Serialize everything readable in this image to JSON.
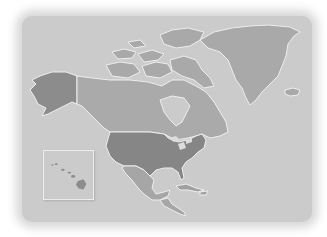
{
  "map": {
    "region": "North America",
    "style": "grayscale",
    "colors": {
      "background": "#ffffff",
      "ocean": "#cbcbcb",
      "border": "#eeeeee",
      "alaska": "#8c8c8c",
      "canada": "#aaaaaa",
      "usa": "#868686",
      "mexico": "#a6a6a6",
      "central_america": "#a6a6a6",
      "caribbean": "#a0a0a0",
      "greenland": "#a9a9a9",
      "iceland": "#a9a9a9",
      "hawaii": "#8c8c8c"
    },
    "regions": [
      {
        "id": "alaska",
        "label": "Alaska",
        "highlighted": true
      },
      {
        "id": "canada",
        "label": "Canada",
        "highlighted": false
      },
      {
        "id": "usa",
        "label": "United States",
        "highlighted": true
      },
      {
        "id": "mexico",
        "label": "Mexico",
        "highlighted": false
      },
      {
        "id": "central-america",
        "label": "Central America",
        "highlighted": false
      },
      {
        "id": "caribbean",
        "label": "Caribbean",
        "highlighted": false
      },
      {
        "id": "greenland",
        "label": "Greenland",
        "highlighted": false
      },
      {
        "id": "iceland",
        "label": "Iceland",
        "highlighted": false
      }
    ],
    "inset": {
      "id": "hawaii",
      "label": "Hawaii"
    }
  }
}
